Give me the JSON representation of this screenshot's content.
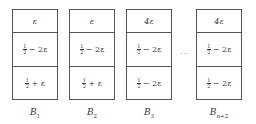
{
  "diagram": {
    "bins": [
      {
        "label_base": "B",
        "label_sub": "1",
        "cells": {
          "top": "ε",
          "middle_frac": "1/2",
          "middle_expr": "− 2ε",
          "bottom_frac": "1/2",
          "bottom_expr": "+ ε"
        }
      },
      {
        "label_base": "B",
        "label_sub": "2",
        "cells": {
          "top": "ε",
          "middle_frac": "1/2",
          "middle_expr": "− 2ε",
          "bottom_frac": "1/2",
          "bottom_expr": "+ ε"
        }
      },
      {
        "label_base": "B",
        "label_sub": "3",
        "cells": {
          "top": "4ε",
          "middle_frac": "1/2",
          "middle_expr": "− 2ε",
          "bottom_frac": "1/2",
          "bottom_expr": "− 2ε"
        }
      },
      {
        "label_base": "B",
        "label_sub": "n+2",
        "cells": {
          "top": "4ε",
          "middle_frac": "1/2",
          "middle_expr": "− 2ε",
          "bottom_frac": "1/2",
          "bottom_expr": "− 2ε"
        }
      }
    ],
    "ellipsis": "···",
    "frac_num": "1",
    "frac_den": "2"
  }
}
